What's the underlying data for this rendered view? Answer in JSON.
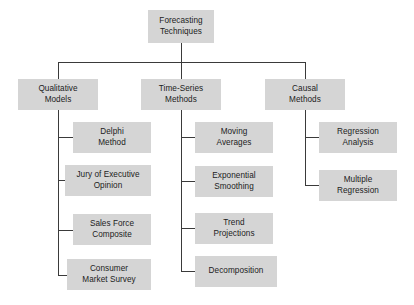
{
  "diagram": {
    "title": "Forecasting Techniques",
    "type": "hierarchy-tree",
    "background_color": "#ffffff",
    "box_fill_color": "#d5d5d5",
    "line_color": "#3a3a3a",
    "text_color": "#1c1c1c"
  },
  "root": {
    "line1": "Forecasting",
    "line2": "Techniques"
  },
  "branches": [
    {
      "id": "qualitative",
      "heading_line1": "Qualitative",
      "heading_line2": "Models",
      "children": [
        {
          "line1": "Delphi",
          "line2": "Method"
        },
        {
          "line1": "Jury of Executive",
          "line2": "Opinion"
        },
        {
          "line1": "Sales Force",
          "line2": "Composite"
        },
        {
          "line1": "Consumer",
          "line2": "Market Survey"
        }
      ]
    },
    {
      "id": "time-series",
      "heading_line1": "Time-Series",
      "heading_line2": "Methods",
      "children": [
        {
          "line1": "Moving",
          "line2": "Averages"
        },
        {
          "line1": "Exponential",
          "line2": "Smoothing"
        },
        {
          "line1": "Trend",
          "line2": "Projections"
        },
        {
          "line1": "Decomposition",
          "line2": ""
        }
      ]
    },
    {
      "id": "causal",
      "heading_line1": "Causal",
      "heading_line2": "Methods",
      "children": [
        {
          "line1": "Regression",
          "line2": "Analysis"
        },
        {
          "line1": "Multiple",
          "line2": "Regression"
        }
      ]
    }
  ]
}
